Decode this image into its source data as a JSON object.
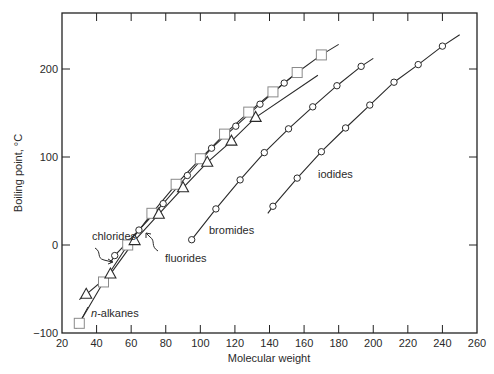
{
  "chart_data": {
    "type": "line",
    "title": "",
    "xlabel": "Molecular weight",
    "ylabel": "Boiling point, °C",
    "xlim": [
      20,
      260
    ],
    "ylim": [
      -100,
      260
    ],
    "xticks": [
      20,
      40,
      60,
      80,
      100,
      120,
      140,
      160,
      180,
      200,
      220,
      240,
      260
    ],
    "yticks": [
      -100,
      0,
      100,
      200
    ],
    "ytick_labels": [
      "−100",
      "0",
      "100",
      "200"
    ],
    "grid": false,
    "legend": "inline labels",
    "series": [
      {
        "name": "n-alkanes",
        "label": "n-alkanes",
        "marker": "square",
        "x": [
          30,
          44,
          58,
          72,
          86,
          100,
          114,
          128,
          142,
          156,
          170
        ],
        "y": [
          -89,
          -42,
          0,
          36,
          69,
          98,
          126,
          151,
          174,
          196,
          216
        ],
        "line_x": [
          28,
          180
        ],
        "line_y": [
          -95,
          228
        ]
      },
      {
        "name": "chlorides",
        "label": "chlorides",
        "marker": "circle",
        "x": [
          50.5,
          64.5,
          78.5,
          92.5,
          106.5,
          120.5,
          134.5,
          148.5
        ],
        "y": [
          -12,
          17,
          47,
          79,
          110,
          135,
          160,
          184
        ],
        "line_x": [
          48,
          156
        ],
        "line_y": [
          -20,
          196
        ]
      },
      {
        "name": "fluorides",
        "label": "fluorides",
        "marker": "triangle",
        "x": [
          34,
          48,
          62,
          76,
          90,
          104,
          118,
          132
        ],
        "y": [
          -56,
          -33,
          5,
          35,
          65,
          94,
          118,
          145
        ],
        "line_x": [
          30,
          168
        ],
        "line_y": [
          -62,
          193
        ]
      },
      {
        "name": "bromides",
        "label": "bromides",
        "marker": "circle",
        "x": [
          95,
          109,
          123,
          137,
          151,
          165,
          179,
          193
        ],
        "y": [
          6,
          41,
          74,
          105,
          132,
          157,
          181,
          203
        ],
        "line_x": [
          95,
          200
        ],
        "line_y": [
          6,
          212
        ]
      },
      {
        "name": "iodides",
        "label": "iodides",
        "marker": "circle",
        "x": [
          142,
          156,
          170,
          184,
          198,
          212,
          226,
          240
        ],
        "y": [
          44,
          76,
          106,
          133,
          159,
          185,
          205,
          226
        ],
        "line_x": [
          139,
          250
        ],
        "line_y": [
          36,
          239
        ]
      }
    ],
    "annotations": [
      {
        "text": "chlorides",
        "x_px": 92,
        "y_px": 240,
        "arrow_to": "chlorides"
      },
      {
        "text": "fluorides",
        "x_px": 165,
        "y_px": 262,
        "arrow_to": "fluorides"
      },
      {
        "text": "bromides",
        "x_px": 209,
        "y_px": 234
      },
      {
        "text": "iodides",
        "x_px": 318,
        "y_px": 178
      },
      {
        "text": "n-alkanes",
        "x_px": 91,
        "y_px": 317
      }
    ]
  }
}
